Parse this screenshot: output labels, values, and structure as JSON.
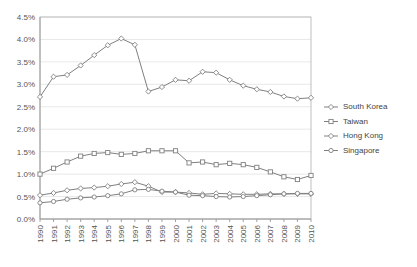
{
  "chart_data": {
    "type": "line",
    "title": "",
    "subtitle": "",
    "xlabel": "",
    "ylabel": "",
    "grid": true,
    "legend_position": "right",
    "ylim": [
      0.0,
      4.5
    ],
    "ytick_step": 0.5,
    "yticks": [
      "0.0%",
      "0.5%",
      "1.0%",
      "1.5%",
      "2.0%",
      "2.5%",
      "3.0%",
      "3.5%",
      "4.0%",
      "4.5%"
    ],
    "ytick_values": [
      0.0,
      0.5,
      1.0,
      1.5,
      2.0,
      2.5,
      3.0,
      3.5,
      4.0,
      4.5
    ],
    "categories": [
      "1990",
      "1991",
      "1992",
      "1993",
      "1994",
      "1995",
      "1996",
      "1997",
      "1998",
      "1999",
      "2000",
      "2001",
      "2002",
      "2003",
      "2004",
      "2005",
      "2006",
      "2007",
      "2008",
      "2009",
      "2010"
    ],
    "value_unit": "percent",
    "series": [
      {
        "name": "South Korea",
        "marker": "diamond",
        "color": "#808080",
        "values": [
          2.72,
          3.17,
          3.21,
          3.42,
          3.65,
          3.87,
          4.02,
          3.88,
          2.84,
          2.94,
          3.1,
          3.08,
          3.28,
          3.26,
          3.1,
          2.97,
          2.89,
          2.83,
          2.73,
          2.68,
          2.7
        ]
      },
      {
        "name": "Taiwan",
        "marker": "square",
        "color": "#808080",
        "values": [
          1.0,
          1.13,
          1.27,
          1.4,
          1.46,
          1.48,
          1.44,
          1.46,
          1.52,
          1.52,
          1.52,
          1.25,
          1.27,
          1.21,
          1.24,
          1.21,
          1.15,
          1.05,
          0.94,
          0.88,
          0.97
        ]
      },
      {
        "name": "Hong Kong",
        "marker": "diamond",
        "color": "#808080",
        "values": [
          0.53,
          0.58,
          0.64,
          0.68,
          0.7,
          0.73,
          0.78,
          0.82,
          0.73,
          0.6,
          0.6,
          0.58,
          0.55,
          0.57,
          0.56,
          0.55,
          0.55,
          0.56,
          0.56,
          0.56,
          0.56
        ]
      },
      {
        "name": "Singapore",
        "marker": "circle",
        "color": "#808080",
        "values": [
          0.36,
          0.39,
          0.44,
          0.47,
          0.49,
          0.52,
          0.56,
          0.65,
          0.66,
          0.62,
          0.6,
          0.53,
          0.52,
          0.5,
          0.49,
          0.5,
          0.52,
          0.54,
          0.56,
          0.57,
          0.57
        ]
      }
    ]
  },
  "legend": {
    "items": [
      {
        "label": "South Korea"
      },
      {
        "label": "Taiwan"
      },
      {
        "label": "Hong Kong"
      },
      {
        "label": "Singapore"
      }
    ]
  }
}
